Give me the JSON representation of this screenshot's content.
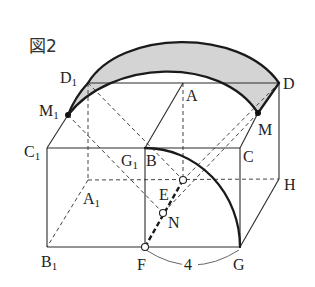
{
  "figure": {
    "title": "図2"
  },
  "labels": {
    "D1": {
      "main": "D",
      "sub": "1"
    },
    "A": {
      "main": "A"
    },
    "D": {
      "main": "D"
    },
    "M1": {
      "main": "M",
      "sub": "1"
    },
    "M": {
      "main": "M"
    },
    "C1": {
      "main": "C",
      "sub": "1"
    },
    "G1": {
      "main": "G",
      "sub": "1"
    },
    "B": {
      "main": "B"
    },
    "C": {
      "main": "C"
    },
    "H": {
      "main": "H"
    },
    "A1": {
      "main": "A",
      "sub": "1"
    },
    "E": {
      "main": "E"
    },
    "N": {
      "main": "N"
    },
    "B1": {
      "main": "B",
      "sub": "1"
    },
    "F": {
      "main": "F"
    },
    "G": {
      "main": "G"
    }
  },
  "dimension": {
    "FG_length": "4"
  },
  "colors": {
    "shade": "#d4d4d4",
    "line": "#1a1a1a"
  }
}
